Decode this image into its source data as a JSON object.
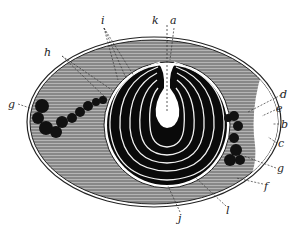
{
  "figure": {
    "type": "anatomical cross-section illustration",
    "colors": {
      "background": "#ffffff",
      "ink": "#111111",
      "hatch_fill": "#8c8c8c",
      "inner_core": "#0a0a0a",
      "cavity": "#ffffff"
    },
    "labels": {
      "i": "i",
      "k": "k",
      "a": "a",
      "h": "h",
      "g_left": "g",
      "d": "d",
      "e": "e",
      "b": "b",
      "c": "c",
      "g_right": "g",
      "f": "f",
      "l": "l",
      "j": "j"
    }
  }
}
